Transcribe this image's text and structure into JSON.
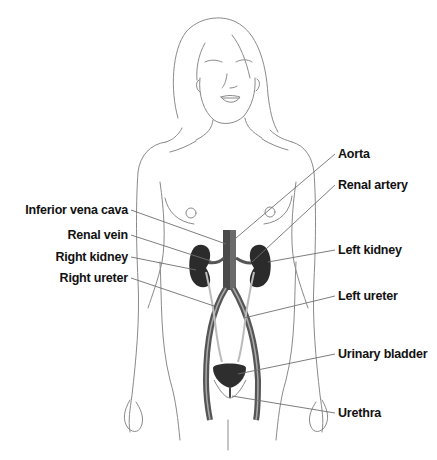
{
  "figure": {
    "colors": {
      "outline": "#8a8a8a",
      "leader_line": "#6e6e6e",
      "organ_dark": "#2b2b2b",
      "vessel": "#5a5a5a",
      "label_text": "#111111",
      "background": "#ffffff"
    }
  },
  "labels": {
    "left": [
      {
        "id": "inferior-vena-cava",
        "text": "Inferior vena cava",
        "x_right": 128,
        "y": 203
      },
      {
        "id": "renal-vein",
        "text": "Renal vein",
        "x_right": 128,
        "y": 228
      },
      {
        "id": "right-kidney",
        "text": "Right kidney",
        "x_right": 128,
        "y": 250
      },
      {
        "id": "right-ureter",
        "text": "Right ureter",
        "x_right": 128,
        "y": 271
      }
    ],
    "right": [
      {
        "id": "aorta",
        "text": "Aorta",
        "x": 338,
        "y": 147
      },
      {
        "id": "renal-artery",
        "text": "Renal artery",
        "x": 338,
        "y": 178
      },
      {
        "id": "left-kidney",
        "text": "Left kidney",
        "x": 338,
        "y": 243
      },
      {
        "id": "left-ureter",
        "text": "Left ureter",
        "x": 338,
        "y": 289
      },
      {
        "id": "urinary-bladder",
        "text": "Urinary bladder",
        "x": 338,
        "y": 347
      },
      {
        "id": "urethra",
        "text": "Urethra",
        "x": 338,
        "y": 406
      }
    ]
  }
}
